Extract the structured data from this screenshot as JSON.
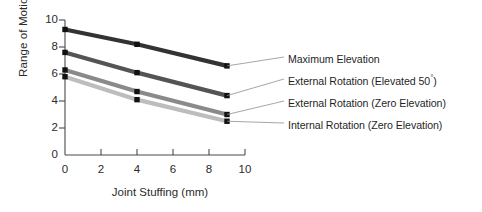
{
  "chart_data": {
    "type": "line",
    "title": "",
    "xlabel": "Joint Stuffing (mm)",
    "ylabel": "Range of Motion (°)",
    "xlim": [
      0,
      10
    ],
    "ylim": [
      0,
      10
    ],
    "xticks": [
      "0",
      "2",
      "4",
      "6",
      "8",
      "10"
    ],
    "yticks": [
      "0",
      "2",
      "4",
      "6",
      "8",
      "10"
    ],
    "grid": false,
    "legend_position": "right-outside",
    "x": [
      0,
      4,
      9
    ],
    "series": [
      {
        "name": "Maximum Elevation",
        "values": [
          9.3,
          8.2,
          6.6
        ],
        "color": "#333333",
        "marker": "square"
      },
      {
        "name": "External Rotation (Elevated 50°)",
        "values": [
          7.6,
          6.1,
          4.4
        ],
        "color": "#545454",
        "marker": "square"
      },
      {
        "name": "External Rotation (Zero Elevation)",
        "values": [
          6.3,
          4.7,
          3.0
        ],
        "color": "#8a8a8a",
        "marker": "square"
      },
      {
        "name": "Internal Rotation (Zero Elevation)",
        "values": [
          5.8,
          4.1,
          2.5
        ],
        "color": "#bdbdbd",
        "marker": "square"
      }
    ]
  },
  "legend": {
    "items": [
      {
        "label_main": "Maximum Elevation",
        "label_suffix": ""
      },
      {
        "label_main": "External Rotation (Elevated 50",
        "label_suffix": ")"
      },
      {
        "label_main": "External Rotation (Zero Elevation)",
        "label_suffix": ""
      },
      {
        "label_main": "Internal Rotation (Zero Elevation)",
        "label_suffix": ""
      }
    ]
  },
  "axes": {
    "y_label_text": "Range of Motion (°)",
    "x_label_text": "Joint Stuffing (mm)",
    "y_tick_0": "0",
    "y_tick_2": "2",
    "y_tick_4": "4",
    "y_tick_6": "6",
    "y_tick_8": "8",
    "y_tick_10": "10",
    "x_tick_0": "0",
    "x_tick_2": "2",
    "x_tick_4": "4",
    "x_tick_6": "6",
    "x_tick_8": "8",
    "x_tick_10": "10"
  }
}
